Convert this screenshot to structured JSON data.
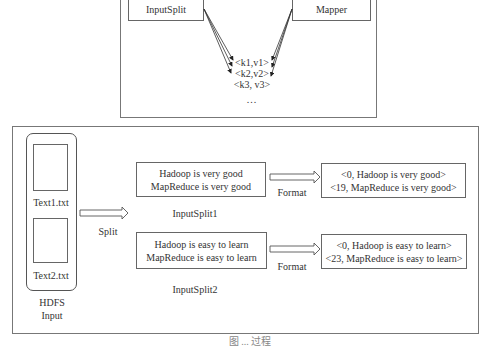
{
  "top_panel": {
    "input_split_label": "InputSplit",
    "mapper_label": "Mapper",
    "pairs": [
      "<k1,v1>",
      "<k2,v2>",
      "<k3, v3>"
    ],
    "ellipsis": "..."
  },
  "bottom_panel": {
    "hdfs": {
      "files": [
        {
          "label": "Text1.txt"
        },
        {
          "label": "Text2.txt"
        }
      ],
      "caption_line1": "HDFS",
      "caption_line2": "Input"
    },
    "split_label": "Split",
    "splits": [
      {
        "lines": [
          "Hadoop is very good",
          "MapReduce is very good"
        ],
        "label": "InputSplit1",
        "format_label": "Format",
        "records": [
          "<0, Hadoop is very good>",
          "<19, MapReduce is very good>"
        ]
      },
      {
        "lines": [
          "Hadoop is easy to learn",
          "MapReduce is easy to learn"
        ],
        "label": "InputSplit2",
        "format_label": "Format",
        "records": [
          "<0, Hadoop is easy to learn>",
          "<23, MapReduce is easy to learn>"
        ]
      }
    ]
  },
  "caption": "图 ... 过程"
}
